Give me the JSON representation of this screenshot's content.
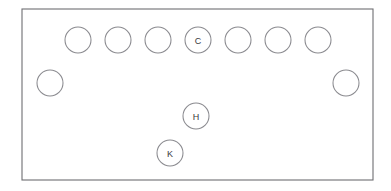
{
  "diagram": {
    "colors": {
      "background": "#ffffff",
      "outline_stroke": "#6e6e72",
      "circle_stroke": "#8a8a8f",
      "label_text": "#3a3a3c"
    },
    "room": {
      "shape": "rectangle",
      "x": 22,
      "y": 9,
      "width": 351,
      "height": 171
    },
    "circle_diameter": 26,
    "groups": [
      {
        "name": "top-row",
        "count": 7,
        "circles": [
          {
            "id": "top-1",
            "label": "",
            "cx": 78,
            "cy": 40
          },
          {
            "id": "top-2",
            "label": "",
            "cx": 118,
            "cy": 40
          },
          {
            "id": "top-3",
            "label": "",
            "cx": 158,
            "cy": 40
          },
          {
            "id": "top-4",
            "label": "C",
            "cx": 198,
            "cy": 40
          },
          {
            "id": "top-5",
            "label": "",
            "cx": 238,
            "cy": 40
          },
          {
            "id": "top-6",
            "label": "",
            "cx": 278,
            "cy": 40
          },
          {
            "id": "top-7",
            "label": "",
            "cx": 318,
            "cy": 40
          }
        ]
      },
      {
        "name": "side-row",
        "count": 2,
        "circles": [
          {
            "id": "side-left",
            "label": "",
            "cx": 50,
            "cy": 83
          },
          {
            "id": "side-right",
            "label": "",
            "cx": 346,
            "cy": 83
          }
        ]
      },
      {
        "name": "interior",
        "count": 2,
        "circles": [
          {
            "id": "interior-h",
            "label": "H",
            "cx": 196,
            "cy": 116
          },
          {
            "id": "interior-k",
            "label": "K",
            "cx": 170,
            "cy": 153
          }
        ]
      }
    ]
  }
}
